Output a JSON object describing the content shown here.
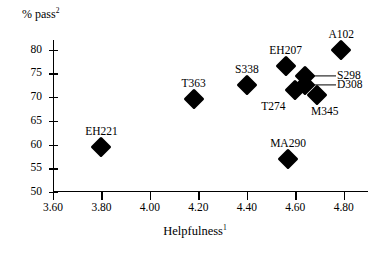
{
  "chart_data": {
    "type": "scatter",
    "title": "",
    "xlabel": "Helpfulness",
    "xlabel_superscript": "1",
    "ylabel": "% pass",
    "ylabel_superscript": "2",
    "xlim": [
      3.6,
      4.9
    ],
    "ylim": [
      50,
      82
    ],
    "xticks": [
      "3.60",
      "3.80",
      "4.00",
      "4.20",
      "4.40",
      "4.60",
      "4.80"
    ],
    "xtick_values": [
      3.6,
      3.8,
      4.0,
      4.2,
      4.4,
      4.6,
      4.8
    ],
    "yticks": [
      "50",
      "55",
      "60",
      "65",
      "70",
      "75",
      "80"
    ],
    "ytick_values": [
      50,
      55,
      60,
      65,
      70,
      75,
      80
    ],
    "grid": false,
    "legend": "none",
    "marker_shape": "diamond",
    "marker_color": "#000000",
    "points": [
      {
        "label": "EH221",
        "x": 3.8,
        "y": 59.5,
        "label_pos": "above"
      },
      {
        "label": "T363",
        "x": 4.18,
        "y": 69.5,
        "label_pos": "above"
      },
      {
        "label": "S338",
        "x": 4.4,
        "y": 72.5,
        "label_pos": "above"
      },
      {
        "label": "EH207",
        "x": 4.56,
        "y": 76.5,
        "label_pos": "above"
      },
      {
        "label": "MA290",
        "x": 4.57,
        "y": 57.0,
        "label_pos": "above"
      },
      {
        "label": "T274",
        "x": 4.6,
        "y": 71.5,
        "label_pos": "below-left"
      },
      {
        "label": "S298",
        "x": 4.64,
        "y": 74.5,
        "label_pos": "leader-right"
      },
      {
        "label": "D308",
        "x": 4.64,
        "y": 72.5,
        "label_pos": "leader-right"
      },
      {
        "label": "M345",
        "x": 4.69,
        "y": 70.5,
        "label_pos": "below-right"
      },
      {
        "label": "A102",
        "x": 4.79,
        "y": 80.0,
        "label_pos": "above"
      }
    ]
  }
}
